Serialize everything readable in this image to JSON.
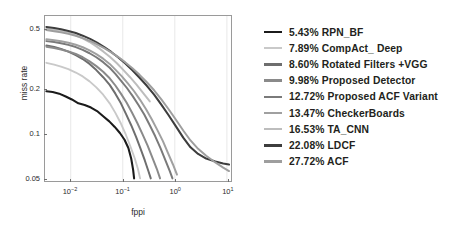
{
  "chart_data": {
    "type": "line",
    "title": "",
    "xlabel": "fppi",
    "ylabel": "miss rate",
    "xscale": "log",
    "yscale": "log",
    "xlim": [
      0.0032,
      12.0
    ],
    "ylim": [
      0.048,
      0.62
    ],
    "grid": true,
    "grid_axis": "x",
    "legend_position": "right-outside",
    "xticks": [
      0.01,
      0.1,
      1,
      10
    ],
    "xtick_labels": [
      "10-2",
      "10-1",
      "100",
      "101"
    ],
    "yticks": [
      0.5,
      0.2,
      0.1,
      0.05
    ],
    "ytick_labels": [
      "0.5",
      "0.2",
      "0.1",
      "0.05"
    ],
    "series": [
      {
        "name": "RPN_BF",
        "score": "5.43%",
        "label": "5.43% RPN_BF",
        "color": "#1b1b1b",
        "width": 2.1,
        "points": [
          [
            0.0034,
            0.193
          ],
          [
            0.0045,
            0.191
          ],
          [
            0.006,
            0.186
          ],
          [
            0.008,
            0.178
          ],
          [
            0.0105,
            0.17
          ],
          [
            0.014,
            0.16
          ],
          [
            0.0185,
            0.156
          ],
          [
            0.0245,
            0.15
          ],
          [
            0.032,
            0.142
          ],
          [
            0.042,
            0.131
          ],
          [
            0.055,
            0.121
          ],
          [
            0.07,
            0.111
          ],
          [
            0.088,
            0.101
          ],
          [
            0.108,
            0.091
          ],
          [
            0.128,
            0.08
          ],
          [
            0.145,
            0.068
          ],
          [
            0.158,
            0.057
          ],
          [
            0.165,
            0.05
          ]
        ]
      },
      {
        "name": "CompAct_Deep",
        "score": "7.89%",
        "label": "7.89% CompAct_ Deep",
        "color": "#c9c9c9",
        "width": 1.9,
        "points": [
          [
            0.0034,
            0.3
          ],
          [
            0.0048,
            0.292
          ],
          [
            0.0065,
            0.283
          ],
          [
            0.009,
            0.272
          ],
          [
            0.0125,
            0.258
          ],
          [
            0.017,
            0.243
          ],
          [
            0.023,
            0.225
          ],
          [
            0.031,
            0.205
          ],
          [
            0.042,
            0.183
          ],
          [
            0.056,
            0.16
          ],
          [
            0.072,
            0.138
          ],
          [
            0.092,
            0.117
          ],
          [
            0.115,
            0.098
          ],
          [
            0.142,
            0.081
          ],
          [
            0.17,
            0.068
          ],
          [
            0.195,
            0.058
          ],
          [
            0.215,
            0.05
          ]
        ]
      },
      {
        "name": "Rotated Filters +VGG",
        "score": "8.60%",
        "label": "8.60% Rotated Filters +VGG",
        "color": "#6e6e6e",
        "width": 2.0,
        "points": [
          [
            0.0034,
            0.393
          ],
          [
            0.0048,
            0.383
          ],
          [
            0.0065,
            0.372
          ],
          [
            0.009,
            0.357
          ],
          [
            0.0125,
            0.338
          ],
          [
            0.017,
            0.318
          ],
          [
            0.023,
            0.295
          ],
          [
            0.031,
            0.268
          ],
          [
            0.042,
            0.24
          ],
          [
            0.056,
            0.213
          ],
          [
            0.072,
            0.186
          ],
          [
            0.092,
            0.16
          ],
          [
            0.115,
            0.136
          ],
          [
            0.145,
            0.114
          ],
          [
            0.18,
            0.095
          ],
          [
            0.22,
            0.079
          ],
          [
            0.265,
            0.066
          ],
          [
            0.31,
            0.056
          ],
          [
            0.345,
            0.05
          ]
        ]
      },
      {
        "name": "Proposed  Detector",
        "score": "9.98%",
        "label": "9.98% Proposed  Detector",
        "color": "#8a8a8a",
        "width": 2.0,
        "points": [
          [
            0.0034,
            0.385
          ],
          [
            0.0048,
            0.378
          ],
          [
            0.0065,
            0.369
          ],
          [
            0.009,
            0.358
          ],
          [
            0.0125,
            0.344
          ],
          [
            0.017,
            0.327
          ],
          [
            0.023,
            0.307
          ],
          [
            0.031,
            0.285
          ],
          [
            0.042,
            0.261
          ],
          [
            0.056,
            0.236
          ],
          [
            0.072,
            0.211
          ],
          [
            0.092,
            0.186
          ],
          [
            0.118,
            0.162
          ],
          [
            0.15,
            0.139
          ],
          [
            0.19,
            0.118
          ],
          [
            0.24,
            0.099
          ],
          [
            0.3,
            0.083
          ],
          [
            0.37,
            0.069
          ],
          [
            0.45,
            0.058
          ],
          [
            0.52,
            0.05
          ]
        ]
      },
      {
        "name": "Proposed ACF Variant",
        "score": "12.72%",
        "label": "12.72% Proposed ACF Variant",
        "color": "#7a7a7a",
        "width": 2.0,
        "points": [
          [
            0.0034,
            0.42
          ],
          [
            0.0048,
            0.414
          ],
          [
            0.0065,
            0.406
          ],
          [
            0.009,
            0.396
          ],
          [
            0.0125,
            0.383
          ],
          [
            0.017,
            0.367
          ],
          [
            0.023,
            0.348
          ],
          [
            0.031,
            0.327
          ],
          [
            0.042,
            0.303
          ],
          [
            0.056,
            0.278
          ],
          [
            0.072,
            0.253
          ],
          [
            0.092,
            0.228
          ],
          [
            0.12,
            0.203
          ],
          [
            0.155,
            0.179
          ],
          [
            0.2,
            0.156
          ],
          [
            0.26,
            0.134
          ],
          [
            0.33,
            0.114
          ],
          [
            0.42,
            0.096
          ],
          [
            0.53,
            0.08
          ],
          [
            0.66,
            0.066
          ],
          [
            0.8,
            0.056
          ],
          [
            0.9,
            0.05
          ]
        ]
      },
      {
        "name": "CheckerBoards",
        "score": "13.47%",
        "label": "13.47% CheckerBoards",
        "color": "#a0a0a0",
        "width": 2.0,
        "points": [
          [
            0.0034,
            0.432
          ],
          [
            0.0048,
            0.426
          ],
          [
            0.0065,
            0.419
          ],
          [
            0.009,
            0.409
          ],
          [
            0.0125,
            0.397
          ],
          [
            0.017,
            0.382
          ],
          [
            0.023,
            0.364
          ],
          [
            0.031,
            0.343
          ],
          [
            0.042,
            0.32
          ],
          [
            0.056,
            0.295
          ],
          [
            0.072,
            0.27
          ],
          [
            0.095,
            0.244
          ],
          [
            0.125,
            0.218
          ],
          [
            0.165,
            0.193
          ],
          [
            0.215,
            0.169
          ],
          [
            0.28,
            0.146
          ],
          [
            0.36,
            0.125
          ],
          [
            0.46,
            0.106
          ],
          [
            0.59,
            0.089
          ],
          [
            0.74,
            0.074
          ],
          [
            0.92,
            0.062
          ],
          [
            1.1,
            0.053
          ]
        ]
      },
      {
        "name": "TA_CNN",
        "score": "16.53%",
        "label": "16.53% TA_CNN",
        "color": "#bdbdbd",
        "width": 2.0,
        "points": [
          [
            0.0034,
            0.508
          ],
          [
            0.0048,
            0.5
          ],
          [
            0.0065,
            0.49
          ],
          [
            0.009,
            0.476
          ],
          [
            0.0125,
            0.459
          ],
          [
            0.017,
            0.438
          ],
          [
            0.023,
            0.414
          ],
          [
            0.031,
            0.387
          ],
          [
            0.042,
            0.358
          ],
          [
            0.057,
            0.328
          ],
          [
            0.077,
            0.298
          ],
          [
            0.103,
            0.268
          ],
          [
            0.138,
            0.24
          ],
          [
            0.185,
            0.213
          ],
          [
            0.245,
            0.188
          ],
          [
            0.3,
            0.172
          ],
          [
            0.33,
            0.165
          ]
        ]
      },
      {
        "name": "LDCF",
        "score": "22.08%",
        "label": "22.08% LDCF",
        "color": "#3d3d3d",
        "width": 2.1,
        "points": [
          [
            0.0034,
            0.523
          ],
          [
            0.0048,
            0.515
          ],
          [
            0.0065,
            0.505
          ],
          [
            0.009,
            0.492
          ],
          [
            0.0125,
            0.476
          ],
          [
            0.017,
            0.457
          ],
          [
            0.0235,
            0.435
          ],
          [
            0.032,
            0.41
          ],
          [
            0.044,
            0.383
          ],
          [
            0.06,
            0.355
          ],
          [
            0.082,
            0.326
          ],
          [
            0.112,
            0.297
          ],
          [
            0.153,
            0.267
          ],
          [
            0.21,
            0.238
          ],
          [
            0.29,
            0.21
          ],
          [
            0.4,
            0.183
          ],
          [
            0.55,
            0.157
          ],
          [
            0.76,
            0.133
          ],
          [
            1.05,
            0.112
          ],
          [
            1.45,
            0.094
          ],
          [
            2.0,
            0.081
          ],
          [
            2.8,
            0.073
          ],
          [
            4.0,
            0.068
          ],
          [
            6.0,
            0.065
          ],
          [
            8.5,
            0.063
          ],
          [
            11.0,
            0.062
          ]
        ]
      },
      {
        "name": "ACF",
        "score": "27.72%",
        "label": "27.72% ACF",
        "color": "#9e9e9e",
        "width": 2.0,
        "points": [
          [
            0.0034,
            0.498
          ],
          [
            0.0048,
            0.49
          ],
          [
            0.0065,
            0.481
          ],
          [
            0.009,
            0.47
          ],
          [
            0.0125,
            0.456
          ],
          [
            0.017,
            0.44
          ],
          [
            0.0235,
            0.421
          ],
          [
            0.032,
            0.4
          ],
          [
            0.044,
            0.377
          ],
          [
            0.06,
            0.353
          ],
          [
            0.082,
            0.328
          ],
          [
            0.112,
            0.302
          ],
          [
            0.153,
            0.276
          ],
          [
            0.21,
            0.249
          ],
          [
            0.29,
            0.222
          ],
          [
            0.4,
            0.196
          ],
          [
            0.55,
            0.17
          ],
          [
            0.76,
            0.146
          ],
          [
            1.05,
            0.124
          ],
          [
            1.45,
            0.105
          ],
          [
            2.0,
            0.09
          ],
          [
            2.8,
            0.079
          ],
          [
            4.0,
            0.071
          ],
          [
            6.0,
            0.064
          ],
          [
            8.5,
            0.059
          ],
          [
            11.0,
            0.056
          ]
        ]
      }
    ]
  },
  "legend": {
    "entries": [
      {
        "label": "5.43% RPN_BF",
        "color": "#1b1b1b"
      },
      {
        "label": "7.89% CompAct_ Deep",
        "color": "#c9c9c9"
      },
      {
        "label": "8.60% Rotated Filters +VGG",
        "color": "#6e6e6e"
      },
      {
        "label": "9.98% Proposed  Detector",
        "color": "#8a8a8a"
      },
      {
        "label": "12.72% Proposed ACF Variant",
        "color": "#7a7a7a"
      },
      {
        "label": "13.47% CheckerBoards",
        "color": "#a0a0a0"
      },
      {
        "label": "16.53% TA_CNN",
        "color": "#bdbdbd"
      },
      {
        "label": "22.08% LDCF",
        "color": "#3d3d3d"
      },
      {
        "label": "27.72% ACF",
        "color": "#9e9e9e"
      }
    ]
  }
}
